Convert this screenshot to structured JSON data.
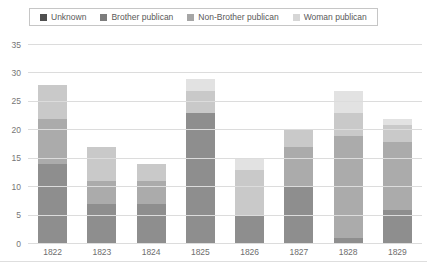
{
  "window": {
    "width": 427,
    "height": 271,
    "background": "#ffffff"
  },
  "colors": {
    "gridline": "#dcdcdc",
    "axis_text": "#767676",
    "x_axis_text": "#6e6e6e",
    "legend_border": "#c6c6c6",
    "legend_text": "#595959"
  },
  "chart_data": {
    "type": "bar",
    "stacked": true,
    "title": "",
    "xlabel": "",
    "ylabel": "",
    "categories": [
      "1822",
      "1823",
      "1824",
      "1825",
      "1826",
      "1827",
      "1828",
      "1829"
    ],
    "series": [
      {
        "name": "Unknown",
        "values": [
          14,
          7,
          7,
          23,
          5,
          10,
          1,
          6
        ],
        "bar_color": "#8e8e8e",
        "legend_color": "#4f4f4f"
      },
      {
        "name": "Brother publican",
        "values": [
          8,
          4,
          4,
          0,
          0,
          7,
          18,
          12
        ],
        "bar_color": "#ababab",
        "legend_color": "#7d7d7d"
      },
      {
        "name": "Non-Brother publican",
        "values": [
          6,
          6,
          3,
          4,
          8,
          3,
          4,
          3
        ],
        "bar_color": "#c9c9c9",
        "legend_color": "#a6a6a6"
      },
      {
        "name": "Woman publican",
        "values": [
          0,
          0,
          0,
          2,
          2,
          0,
          4,
          1
        ],
        "bar_color": "#e2e2e2",
        "legend_color": "#d6d6d6"
      }
    ],
    "totals": [
      28,
      17,
      14,
      29,
      15,
      20,
      27,
      22
    ],
    "ylim": [
      0,
      35
    ],
    "ytick_step": 5,
    "grid": true,
    "legend_position": "top"
  }
}
